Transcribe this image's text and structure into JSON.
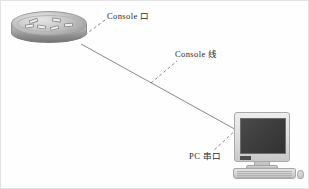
{
  "diagram": {
    "background_color": "#fefefe",
    "border_color": "#e3e3e3",
    "labels": {
      "console_port": "Console 口",
      "console_cable": "Console 线",
      "pc_serial_port": "PC 串口"
    },
    "nodes": {
      "router": {
        "name": "router-device",
        "shape": "cylinder",
        "color": "#b2b2b2"
      },
      "pc": {
        "name": "desktop-computer",
        "shape": "crt-monitor",
        "screen_color": "#3c3c3c",
        "case_color": "#dcdcdc"
      }
    },
    "connections": [
      {
        "name": "console-cable-line",
        "style": "solid",
        "color": "#6b6b6b",
        "from": "router",
        "to": "pc"
      },
      {
        "name": "console-port-leader",
        "style": "dashed",
        "color": "#6b6b6b",
        "from": "router",
        "to": "console_port_label"
      },
      {
        "name": "console-cable-leader",
        "style": "dashed",
        "color": "#6b6b6b",
        "from": "console_cable_line",
        "to": "console_cable_label"
      },
      {
        "name": "pc-serial-leader",
        "style": "dashed",
        "color": "#6b6b6b",
        "from": "pc",
        "to": "pc_serial_label"
      }
    ]
  }
}
